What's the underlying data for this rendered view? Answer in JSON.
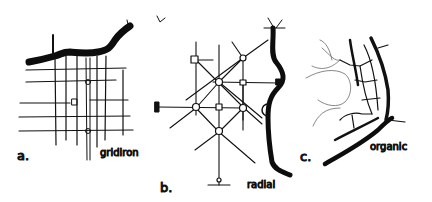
{
  "diagram": {
    "panels": [
      {
        "letter": "a.",
        "name": "gridiron"
      },
      {
        "letter": "b.",
        "name": "radial"
      },
      {
        "letter": "c.",
        "name": "organic"
      }
    ]
  }
}
